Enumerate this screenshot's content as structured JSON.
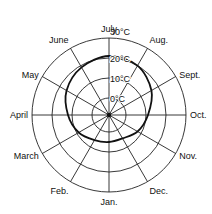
{
  "chart_data": {
    "type": "polar-line",
    "title": "",
    "categories": [
      "Jan.",
      "Feb.",
      "March",
      "April",
      "May",
      "June",
      "July",
      "Aug.",
      "Sept.",
      "Oct.",
      "Nov.",
      "Dec."
    ],
    "series": [
      {
        "name": "Monthly mean temperature",
        "values": [
          5,
          6,
          9,
          12,
          16,
          19,
          21,
          20,
          16,
          11,
          8,
          5
        ]
      }
    ],
    "radial_ticks": [
      "0°C",
      "10°C",
      "20°C",
      "30°C"
    ],
    "radial_tick_values": [
      0,
      10,
      20,
      30
    ],
    "rlim": [
      -8.5,
      30
    ],
    "unit": "°C",
    "grid": true,
    "legend": "none"
  },
  "geometry": {
    "cx": 109,
    "cy": 115,
    "r0": 17,
    "px_per_degree": 2
  },
  "colors": {
    "ink": "#111111",
    "background": "#ffffff"
  }
}
